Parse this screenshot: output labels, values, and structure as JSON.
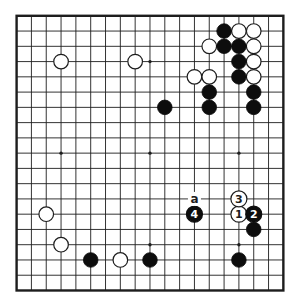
{
  "diagram": {
    "type": "go-board-diagram",
    "board_size": 19,
    "colors": {
      "background": "#ffffff",
      "line": "#1d1d1d",
      "black_stone": "#0d0d0d",
      "white_stone": "#ffffff",
      "white_stone_outline": "#1d1d1d",
      "number_on_black": "#ffffff",
      "number_on_white": "#1d1d1d",
      "label_text": "#1d1d1d"
    },
    "star_points_visible": [
      [
        10,
        4
      ],
      [
        4,
        10
      ],
      [
        10,
        10
      ],
      [
        16,
        10
      ],
      [
        10,
        16
      ],
      [
        16,
        16
      ]
    ],
    "white_stones": [
      [
        4,
        4
      ],
      [
        9,
        4
      ],
      [
        16,
        2
      ],
      [
        17,
        2
      ],
      [
        14,
        3
      ],
      [
        17,
        3
      ],
      [
        17,
        4
      ],
      [
        13,
        5
      ],
      [
        14,
        5
      ],
      [
        17,
        5
      ],
      [
        3,
        14
      ],
      [
        4,
        16
      ],
      [
        8,
        17
      ]
    ],
    "black_stones": [
      [
        15,
        2
      ],
      [
        15,
        3
      ],
      [
        16,
        3
      ],
      [
        16,
        4
      ],
      [
        16,
        5
      ],
      [
        14,
        6
      ],
      [
        17,
        6
      ],
      [
        11,
        7
      ],
      [
        14,
        7
      ],
      [
        17,
        7
      ],
      [
        17,
        15
      ],
      [
        6,
        17
      ],
      [
        10,
        17
      ],
      [
        16,
        17
      ]
    ],
    "move_stones": [
      {
        "label": "1",
        "color": "white",
        "col": 16,
        "row": 14
      },
      {
        "label": "2",
        "color": "black",
        "col": 17,
        "row": 14
      },
      {
        "label": "3",
        "color": "white",
        "col": 16,
        "row": 13
      },
      {
        "label": "4",
        "color": "black",
        "col": 13,
        "row": 14
      }
    ],
    "point_labels": [
      {
        "label": "a",
        "col": 13,
        "row": 13
      }
    ]
  }
}
